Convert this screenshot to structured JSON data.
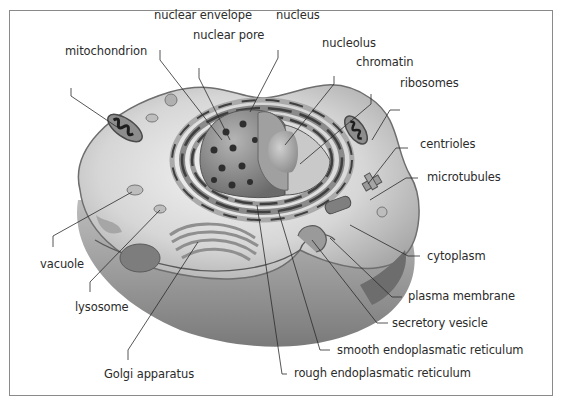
{
  "diagram": {
    "type": "labeled-illustration",
    "colors": {
      "frame": "#8a8a8a",
      "leader_line": "#2b2b2b",
      "label_text": "#2b2b2b",
      "cytoplasm": "#d9d9d9",
      "membrane": "#6e6e6e",
      "nucleus": "#8c8c8c"
    },
    "labels": [
      {
        "id": "nuclear-envelope",
        "text": "nuclear envelope"
      },
      {
        "id": "nucleus",
        "text": "nucleus"
      },
      {
        "id": "nuclear-pore",
        "text": "nuclear pore"
      },
      {
        "id": "mitochondrion",
        "text": "mitochondrion"
      },
      {
        "id": "nucleolus",
        "text": "nucleolus"
      },
      {
        "id": "chromatin",
        "text": "chromatin"
      },
      {
        "id": "ribosomes",
        "text": "ribosomes"
      },
      {
        "id": "centrioles",
        "text": "centrioles"
      },
      {
        "id": "microtubules",
        "text": "microtubules"
      },
      {
        "id": "vacuole",
        "text": "vacuole"
      },
      {
        "id": "cytoplasm",
        "text": "cytoplasm"
      },
      {
        "id": "lysosome",
        "text": "lysosome"
      },
      {
        "id": "plasma-membrane",
        "text": "plasma membrane"
      },
      {
        "id": "secretory-vesicle",
        "text": "secretory vesicle"
      },
      {
        "id": "smooth-er",
        "text": "smooth endoplasmatic reticulum"
      },
      {
        "id": "golgi-apparatus",
        "text": "Golgi apparatus"
      },
      {
        "id": "rough-er",
        "text": "rough endoplasmatic reticulum"
      }
    ]
  }
}
